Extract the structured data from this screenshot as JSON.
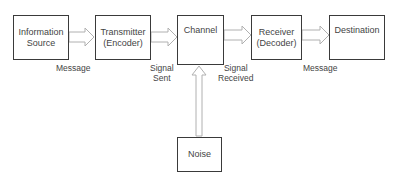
{
  "diagram": {
    "nodes": [
      {
        "id": "source",
        "line1": "Information",
        "line2": "Source"
      },
      {
        "id": "transmitter",
        "line1": "Transmitter",
        "line2": "(Encoder)"
      },
      {
        "id": "channel",
        "line1": "Channel",
        "line2": ""
      },
      {
        "id": "receiver",
        "line1": "Receiver",
        "line2": "(Decoder)"
      },
      {
        "id": "destination",
        "line1": "Destination",
        "line2": ""
      },
      {
        "id": "noise",
        "line1": "Noise",
        "line2": ""
      }
    ],
    "edge_labels": [
      {
        "line1": "Message",
        "line2": ""
      },
      {
        "line1": "Signal",
        "line2": "Sent"
      },
      {
        "line1": "Signal",
        "line2": "Received"
      },
      {
        "line1": "Message",
        "line2": ""
      }
    ],
    "colors": {
      "box_border": "#3a3a3a",
      "arrow_stroke": "#b0b0b0",
      "text": "#444444"
    }
  }
}
